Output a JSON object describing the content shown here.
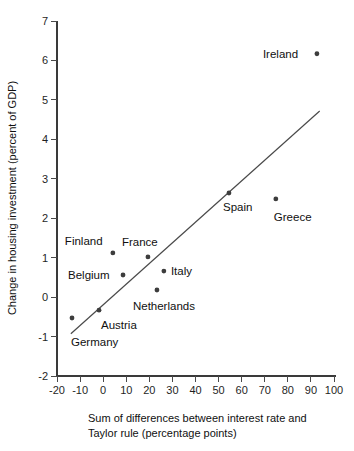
{
  "chart_data": {
    "type": "scatter",
    "title": "",
    "xlabel": "Sum of differences between interest rate and Taylor rule (percentage points)",
    "xlabel_line1": "Sum of differences between interest rate and",
    "xlabel_line2": "Taylor rule (percentage points)",
    "ylabel": "Change in housing investment (percent of GDP)",
    "xlim": [
      -20,
      100
    ],
    "ylim": [
      -2,
      7
    ],
    "xticks": [
      -20,
      -10,
      0,
      10,
      20,
      30,
      40,
      50,
      60,
      70,
      80,
      90,
      100
    ],
    "xticklabels": [
      "-20",
      "-10",
      "0",
      "10",
      "20",
      "30",
      "40",
      "50",
      "60",
      "70",
      "80",
      "90",
      "100"
    ],
    "yticks": [
      -2,
      -1,
      0,
      1,
      2,
      3,
      4,
      5,
      6,
      7
    ],
    "yticklabels": [
      "-2",
      "-1",
      "0",
      "1",
      "2",
      "3",
      "4",
      "5",
      "6",
      "7"
    ],
    "grid": false,
    "legend": false,
    "marker_color": "#3d3d3d",
    "line_color": "#4a4a4a",
    "points": [
      {
        "label": "Germany",
        "x": -13.5,
        "y": -0.53,
        "label_dx": -1,
        "label_dy": 28,
        "anchor": "start"
      },
      {
        "label": "Austria",
        "x": -1.8,
        "y": -0.33,
        "label_dx": 2,
        "label_dy": 19,
        "anchor": "start"
      },
      {
        "label": "Finland",
        "x": 4.2,
        "y": 1.12,
        "label_dx": -48,
        "label_dy": -8,
        "anchor": "start"
      },
      {
        "label": "Belgium",
        "x": 8.6,
        "y": 0.56,
        "label_dx": -55,
        "label_dy": 4,
        "anchor": "start"
      },
      {
        "label": "France",
        "x": 19.4,
        "y": 1.02,
        "label_dx": -26,
        "label_dy": -11,
        "anchor": "start"
      },
      {
        "label": "Netherlands",
        "x": 23.3,
        "y": 0.18,
        "label_dx": -24,
        "label_dy": 20,
        "anchor": "start"
      },
      {
        "label": "Italy",
        "x": 26.3,
        "y": 0.66,
        "label_dx": 7,
        "label_dy": 4,
        "anchor": "start"
      },
      {
        "label": "Spain",
        "x": 54.5,
        "y": 2.64,
        "label_dx": -6,
        "label_dy": 18,
        "anchor": "start"
      },
      {
        "label": "Greece",
        "x": 74.8,
        "y": 2.49,
        "label_dx": -2,
        "label_dy": 22,
        "anchor": "start"
      },
      {
        "label": "Ireland",
        "x": 92.6,
        "y": 6.17,
        "label_dx": -54,
        "label_dy": 4,
        "anchor": "start"
      }
    ],
    "trendline": {
      "x1": -14.0,
      "y1": -0.93,
      "x2": 93.8,
      "y2": 4.72
    }
  }
}
